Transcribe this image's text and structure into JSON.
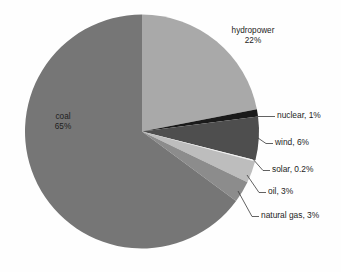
{
  "chart_data": {
    "type": "pie",
    "title": "",
    "subtitle": "",
    "xlabel": "",
    "ylabel": "",
    "legend_position": "none",
    "grid": false,
    "labels_inside": [
      "coal",
      "hydropower"
    ],
    "categories": [
      "hydropower",
      "nuclear",
      "wind",
      "solar",
      "oil",
      "natural gas",
      "coal"
    ],
    "values": [
      22,
      1,
      6,
      0.2,
      3,
      3,
      65
    ],
    "unit": "%",
    "start_angle_deg": 0,
    "direction": "clockwise",
    "colors": [
      "#a9a9a9",
      "#1a1a1a",
      "#4e4e4e",
      "#f2f2f2",
      "#bdbdbd",
      "#8c8c8c",
      "#767676"
    ],
    "slices": [
      {
        "name": "hydropower",
        "value": 22,
        "label": "hydropower",
        "percent_text": "22%",
        "color": "#a9a9a9",
        "label_style": "inside-two-line",
        "label_x": 253,
        "label_y": 33,
        "percent_x": 253,
        "percent_y": 43
      },
      {
        "name": "nuclear",
        "value": 1,
        "label": "nuclear, 1%",
        "percent_text": "1%",
        "color": "#1a1a1a",
        "label_style": "callout",
        "label_x": 277,
        "label_y": 118,
        "leader": "M 257.5 116.5 L 268 116.5 L 275 116.5"
      },
      {
        "name": "wind",
        "value": 6,
        "label": "wind, 6%",
        "percent_text": "6%",
        "color": "#4e4e4e",
        "label_style": "callout",
        "label_x": 275,
        "label_y": 145,
        "leader": "M 258 138 L 266 143.5 L 273 143.5"
      },
      {
        "name": "solar",
        "value": 0.2,
        "label": "solar, 0.2%",
        "percent_text": "0.2%",
        "color": "#f2f2f2",
        "label_style": "callout",
        "label_x": 272,
        "label_y": 172,
        "leader": "M 252 158 L 263 170.5 L 270 170.5"
      },
      {
        "name": "oil",
        "value": 3,
        "label": "oil, 3%",
        "percent_text": "3%",
        "color": "#bdbdbd",
        "label_style": "callout",
        "label_x": 268,
        "label_y": 194,
        "leader": "M 247 175 L 259 192.5 L 266 192.5"
      },
      {
        "name": "natural gas",
        "value": 3,
        "label": "natural gas, 3%",
        "percent_text": "3%",
        "color": "#8c8c8c",
        "label_style": "callout",
        "label_x": 261,
        "label_y": 218,
        "leader": "M 238 191 L 252 216.5 L 259 216.5"
      },
      {
        "name": "coal",
        "value": 65,
        "label": "coal",
        "percent_text": "65%",
        "color": "#767676",
        "label_style": "inside-two-line",
        "label_x": 63,
        "label_y": 119,
        "percent_x": 63,
        "percent_y": 129
      }
    ],
    "geometry": {
      "cx": 142,
      "cy": 131.5,
      "r": 117
    },
    "background_color": "#fefefe"
  }
}
